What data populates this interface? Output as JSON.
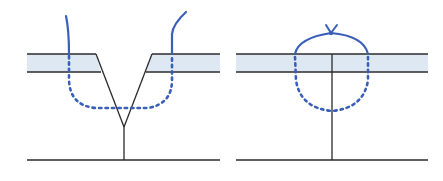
{
  "diagram": {
    "colors": {
      "background": "#ffffff",
      "tissue_band_fill": "#dde8f3",
      "outline": "#2b2b2b",
      "thread": "#3a5fb8"
    },
    "panels": [
      {
        "id": "left",
        "label": "",
        "wound_shape": "V-shaped cut",
        "stitch_shape": "deep U loop (dotted beneath surface)"
      },
      {
        "id": "right",
        "label": "",
        "wound_shape": "straight vertical incision",
        "stitch_shape": "round loop with knot on top"
      }
    ]
  }
}
